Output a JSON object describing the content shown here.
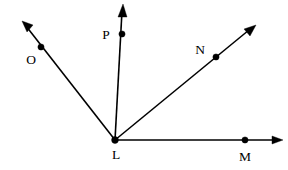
{
  "figure": {
    "background_color": "#ffffff",
    "stroke_color": "#000000",
    "vertex": {
      "name": "L",
      "label": "L",
      "x": 115,
      "y": 140,
      "label_x": 116,
      "label_y": 159,
      "dot_radius": 3.1
    },
    "rays": [
      {
        "id": "ray-lo",
        "label": "O",
        "from_label": "L",
        "to_label": "O",
        "start_x": 115,
        "start_y": 140,
        "end_x": 22,
        "end_y": 21,
        "arrow_angle_deg": 232,
        "point": {
          "name": "O",
          "x": 41,
          "y": 47,
          "dot_radius": 3.1,
          "label_x": 31,
          "label_y": 64
        }
      },
      {
        "id": "ray-lp",
        "label": "P",
        "from_label": "L",
        "to_label": "P",
        "start_x": 115,
        "start_y": 140,
        "end_x": 123,
        "end_y": 5,
        "arrow_angle_deg": 273,
        "point": {
          "name": "P",
          "x": 122,
          "y": 34,
          "dot_radius": 3.1,
          "label_x": 106,
          "label_y": 39
        }
      },
      {
        "id": "ray-ln",
        "label": "N",
        "from_label": "L",
        "to_label": "N",
        "start_x": 115,
        "start_y": 140,
        "end_x": 255,
        "end_y": 25,
        "arrow_angle_deg": 320,
        "point": {
          "name": "N",
          "x": 216,
          "y": 57,
          "dot_radius": 3.1,
          "label_x": 200,
          "label_y": 54
        }
      },
      {
        "id": "ray-lm",
        "label": "M",
        "from_label": "L",
        "to_label": "M",
        "start_x": 115,
        "start_y": 140,
        "end_x": 283,
        "end_y": 140,
        "arrow_angle_deg": 0,
        "point": {
          "name": "M",
          "x": 245,
          "y": 140,
          "dot_radius": 3.1,
          "label_x": 245,
          "label_y": 161
        }
      }
    ],
    "labels": {
      "O": "O",
      "P": "P",
      "N": "N",
      "M": "M",
      "L": "L"
    }
  }
}
